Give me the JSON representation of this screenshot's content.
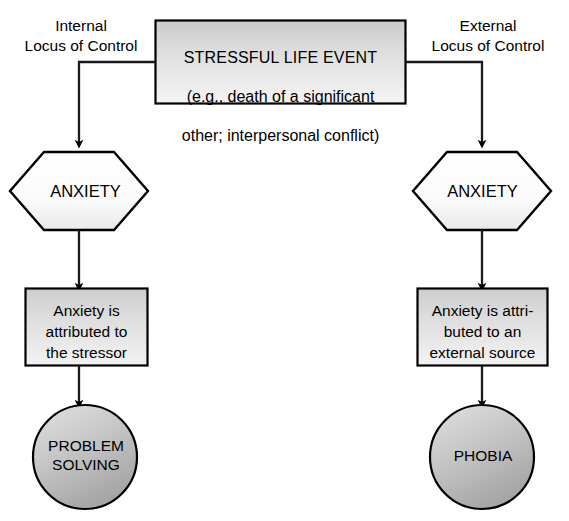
{
  "diagram": {
    "columns": {
      "left_heading": "Internal\nLocus of Control",
      "right_heading": "External\nLocus of Control"
    },
    "central_node": {
      "shape": "rectangle",
      "line1": "STRESSFUL LIFE EVENT",
      "line2": "(e.g., death of a significant",
      "line3": "other; interpersonal conflict)"
    },
    "left_path": {
      "hexagon_label": "ANXIETY",
      "rectangle_label": "Anxiety is\nattributed to\nthe stressor",
      "circle_label": "PROBLEM\nSOLVING"
    },
    "right_path": {
      "hexagon_label": "ANXIETY",
      "rectangle_label": "Anxiety is attri-\nbuted to an\nexternal source",
      "circle_label": "PHOBIA"
    },
    "colors": {
      "stroke": "#000000",
      "box_fill_top": "#cfcfcf",
      "box_fill_bottom": "#f2f2f2",
      "hexagon_fill_top": "#ffffff",
      "hexagon_fill_bottom": "#ededed",
      "circle_fill_top": "#d6d6d6",
      "circle_fill_bottom": "#a8a8a8",
      "background": "#ffffff",
      "text": "#000000"
    },
    "connectors": [
      {
        "name": "event-to-left-anxiety",
        "from": "central_node",
        "to": "left_hexagon",
        "arrow": true
      },
      {
        "name": "event-to-right-anxiety",
        "from": "central_node",
        "to": "right_hexagon",
        "arrow": true
      },
      {
        "name": "left-anxiety-to-attribution",
        "from": "left_hexagon",
        "to": "left_rectangle",
        "arrow": true
      },
      {
        "name": "left-attribution-to-outcome",
        "from": "left_rectangle",
        "to": "left_circle",
        "arrow": true
      },
      {
        "name": "right-anxiety-to-attribution",
        "from": "right_hexagon",
        "to": "right_rectangle",
        "arrow": true
      },
      {
        "name": "right-attribution-to-outcome",
        "from": "right_rectangle",
        "to": "right_circle",
        "arrow": true
      }
    ]
  }
}
